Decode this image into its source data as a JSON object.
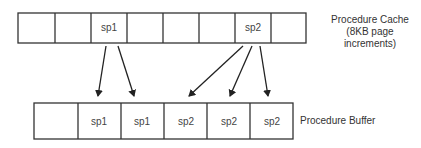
{
  "cache": {
    "label_line1": "Procedure Cache",
    "label_line2": "(8KB page increments)",
    "cells": [
      "",
      "",
      "sp1",
      "",
      "",
      "",
      "sp2",
      ""
    ]
  },
  "buffer": {
    "label": "Procedure Buffer",
    "cells": [
      "",
      "sp1",
      "sp1",
      "sp2",
      "sp2",
      "sp2"
    ]
  },
  "arrows": [
    {
      "from": "cache.2",
      "to": "buffer.1"
    },
    {
      "from": "cache.2",
      "to": "buffer.2"
    },
    {
      "from": "cache.6",
      "to": "buffer.3"
    },
    {
      "from": "cache.6",
      "to": "buffer.4"
    },
    {
      "from": "cache.6",
      "to": "buffer.5"
    }
  ]
}
